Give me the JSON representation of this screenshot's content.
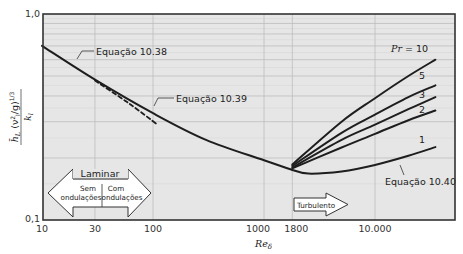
{
  "chart_data": {
    "type": "line",
    "title": "",
    "xlabel": "Re_δ",
    "ylabel": "h̄_L (ν_l²/g)^{1/3} / k_l",
    "xscale": "log",
    "yscale": "log",
    "xlim": [
      10,
      52000
    ],
    "ylim": [
      0.1,
      1.0
    ],
    "grid": true,
    "x_ticks": [
      {
        "value": 10,
        "label": "10"
      },
      {
        "value": 30,
        "label": "30"
      },
      {
        "value": 100,
        "label": "100"
      },
      {
        "value": 1000,
        "label": "1000"
      },
      {
        "value": 1800,
        "label": "1800"
      },
      {
        "value": 10000,
        "label": "10.000"
      }
    ],
    "y_ticks": [
      {
        "value": 0.1,
        "label": "0,1"
      },
      {
        "value": 1.0,
        "label": "1,0"
      }
    ],
    "series": [
      {
        "name": "Equação 10.38",
        "style": "solid",
        "points": [
          [
            10,
            0.7
          ],
          [
            30,
            0.48
          ],
          [
            100,
            0.33
          ],
          [
            300,
            0.245
          ],
          [
            1000,
            0.195
          ],
          [
            1800,
            0.175
          ]
        ]
      },
      {
        "name": "Equação 10.39",
        "style": "dashed",
        "points": [
          [
            30,
            0.475
          ],
          [
            60,
            0.37
          ],
          [
            110,
            0.29
          ]
        ]
      },
      {
        "name": "Equação 10.40 (Pr = 1)",
        "style": "solid",
        "points": [
          [
            1800,
            0.175
          ],
          [
            2500,
            0.168
          ],
          [
            5000,
            0.172
          ],
          [
            10000,
            0.185
          ],
          [
            20000,
            0.205
          ],
          [
            35000,
            0.226
          ]
        ]
      },
      {
        "name": "Pr = 2",
        "style": "solid",
        "points": [
          [
            1800,
            0.178
          ],
          [
            5000,
            0.225
          ],
          [
            10000,
            0.262
          ],
          [
            20000,
            0.305
          ],
          [
            35000,
            0.34
          ]
        ]
      },
      {
        "name": "Pr = 3",
        "style": "solid",
        "points": [
          [
            1800,
            0.18
          ],
          [
            5000,
            0.245
          ],
          [
            10000,
            0.29
          ],
          [
            20000,
            0.345
          ],
          [
            35000,
            0.395
          ]
        ]
      },
      {
        "name": "Pr = 5",
        "style": "solid",
        "points": [
          [
            1800,
            0.183
          ],
          [
            5000,
            0.265
          ],
          [
            10000,
            0.325
          ],
          [
            20000,
            0.395
          ],
          [
            35000,
            0.45
          ]
        ]
      },
      {
        "name": "Pr = 10",
        "style": "solid",
        "points": [
          [
            1800,
            0.186
          ],
          [
            5000,
            0.3
          ],
          [
            10000,
            0.39
          ],
          [
            20000,
            0.5
          ],
          [
            35000,
            0.6
          ]
        ]
      }
    ],
    "annotations": [
      {
        "text": "Equação 10.38"
      },
      {
        "text": "Equação 10.39"
      },
      {
        "text": "Equação 10.40"
      },
      {
        "text": "Pr = 10"
      },
      {
        "text": "5"
      },
      {
        "text": "3"
      },
      {
        "text": "2"
      },
      {
        "text": "1"
      },
      {
        "text": "Laminar"
      },
      {
        "text": "Sem ondulações"
      },
      {
        "text": "Com ondulações"
      },
      {
        "text": "Turbulento"
      }
    ]
  },
  "labels": {
    "y_top": "1,0",
    "y_bottom": "0,1",
    "x_ticks": [
      "10",
      "30",
      "100",
      "1000",
      "1800",
      "10.000"
    ],
    "x_axis": "Re",
    "x_axis_sub": "δ",
    "y_axis_h": "h",
    "y_axis_sub": "L",
    "y_axis_rest": "(ν²/g)",
    "y_axis_exp": "1/3",
    "y_axis_den": "k",
    "y_axis_den_sub": "l",
    "eq1038": "Equação 10.38",
    "eq1039": "Equação 10.39",
    "eq1040": "Equação 10.40",
    "pr10": "Pr = 10",
    "pr5": "5",
    "pr3": "3",
    "pr2": "2",
    "pr1": "1",
    "laminar": "Laminar",
    "sem1": "Sem",
    "sem2": "ondulações",
    "com1": "Com",
    "com2": "ondulações",
    "turbulento": "Turbulento"
  },
  "colors": {
    "plot_bg": "#e6e6e6",
    "grid": "#bdbdbd",
    "frame": "#333333",
    "curve": "#1e1e1e"
  }
}
